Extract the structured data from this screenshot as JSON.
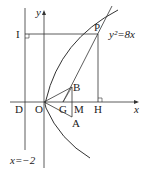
{
  "diagram": {
    "curve_label": "y²=8x",
    "directrix_label": "x=−2",
    "axis_x_label": "x",
    "axis_y_label": "y",
    "points": {
      "P": "P",
      "I": "I",
      "D": "D",
      "O": "O",
      "G": "G",
      "M": "M",
      "H": "H",
      "A": "A",
      "B": "B"
    },
    "colors": {
      "stroke": "#333333",
      "background": "#ffffff"
    }
  }
}
